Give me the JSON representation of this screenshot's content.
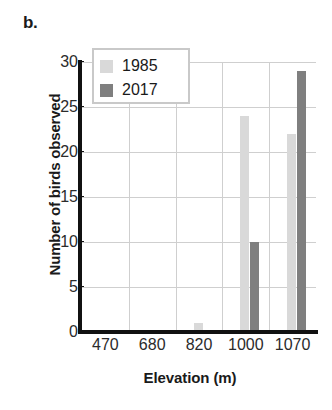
{
  "panel": {
    "label": "b."
  },
  "chart_data": {
    "type": "bar",
    "title": "",
    "xlabel": "Elevation (m)",
    "ylabel": "Number of birds observed",
    "categories": [
      "470",
      "680",
      "820",
      "1000",
      "1070"
    ],
    "series": [
      {
        "name": "1985",
        "color": "#d9d9d9",
        "values": [
          0,
          0,
          1,
          24,
          22
        ]
      },
      {
        "name": "2017",
        "color": "#7f7f7f",
        "values": [
          0,
          0,
          0,
          10,
          29
        ]
      }
    ],
    "ylim": [
      0,
      30
    ],
    "yticks": [
      0,
      5,
      10,
      15,
      20,
      25,
      30
    ],
    "ytick_labels": [
      "0",
      "5",
      "10",
      "15",
      "20",
      "25",
      "30"
    ],
    "grid": true,
    "legend_position": "top-left"
  }
}
